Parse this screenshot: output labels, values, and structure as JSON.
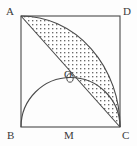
{
  "figure": {
    "background_color": "#fdfdfd",
    "stroke_color": "#4a4a4a",
    "shade_dot_color": "#6b6b6b",
    "label_color": "#3a3a3a",
    "stroke_width": 1.1
  },
  "labels": {
    "a": "A",
    "b": "B",
    "c": "C",
    "d": "D",
    "m": "M",
    "o": "O"
  },
  "geometry": {
    "square": {
      "name": "ABDC",
      "left": 21,
      "top": 16,
      "right": 120,
      "bottom": 127,
      "width": 99,
      "height": 111
    },
    "vertices": {
      "A": {
        "x": 21,
        "y": 16,
        "label_x": 6,
        "label_y": 6
      },
      "D": {
        "x": 120,
        "y": 16,
        "label_x": 123,
        "label_y": 6
      },
      "B": {
        "x": 21,
        "y": 127,
        "label_x": 7,
        "label_y": 130
      },
      "C": {
        "x": 120,
        "y": 127,
        "label_x": 122,
        "label_y": 130
      },
      "M": {
        "x": 70,
        "y": 127,
        "label_x": 64,
        "label_y": 130
      },
      "O": {
        "x": 70,
        "y": 76,
        "label_x": 64,
        "label_y": 70
      }
    },
    "quarter_arc": {
      "description": "arc from A to C centered at C",
      "center_x": 120,
      "center_y": 127,
      "radius_x": 99,
      "radius_y": 111,
      "from": "A",
      "to": "C"
    },
    "semicircle": {
      "description": "semicircle on BC as diameter, center M",
      "center_x": 70,
      "center_y": 127,
      "radius": 49,
      "from": "B",
      "to": "C"
    },
    "diagonal": {
      "description": "segment from A to C",
      "x1": 21,
      "y1": 16,
      "x2": 120,
      "y2": 127
    },
    "shaded_region": {
      "description": "region between quarter arc AC and diagonal AC",
      "fill": "dot-stipple"
    }
  }
}
